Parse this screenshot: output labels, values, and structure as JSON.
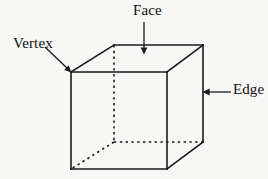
{
  "figure": {
    "background_color": "#f7f7f6",
    "ink_color": "#1a1a1a",
    "width": 268,
    "height": 179,
    "shape": {
      "name": "cube",
      "projection": "oblique",
      "front_face": [
        [
          71,
          72
        ],
        [
          167,
          72
        ],
        [
          167,
          169
        ],
        [
          71,
          169
        ]
      ],
      "back_face": [
        [
          114,
          45
        ],
        [
          203,
          45
        ],
        [
          203,
          142
        ],
        [
          114,
          142
        ]
      ],
      "solid_edges": [
        [
          [
            71,
            72
          ],
          [
            167,
            72
          ]
        ],
        [
          [
            167,
            72
          ],
          [
            167,
            169
          ]
        ],
        [
          [
            167,
            169
          ],
          [
            71,
            169
          ]
        ],
        [
          [
            71,
            169
          ],
          [
            71,
            72
          ]
        ],
        [
          [
            114,
            45
          ],
          [
            203,
            45
          ]
        ],
        [
          [
            203,
            45
          ],
          [
            203,
            142
          ]
        ],
        [
          [
            71,
            72
          ],
          [
            114,
            45
          ]
        ],
        [
          [
            167,
            72
          ],
          [
            203,
            45
          ]
        ],
        [
          [
            167,
            169
          ],
          [
            203,
            142
          ]
        ]
      ],
      "dashed_edges": [
        [
          [
            114,
            45
          ],
          [
            114,
            142
          ]
        ],
        [
          [
            114,
            142
          ],
          [
            203,
            142
          ]
        ],
        [
          [
            114,
            142
          ],
          [
            71,
            169
          ]
        ]
      ]
    },
    "labels": [
      {
        "id": "vertex",
        "text": "Vertex",
        "anchor": [
          45,
          47
        ],
        "target": [
          71,
          72
        ],
        "arrow": "diagonal-down-right"
      },
      {
        "id": "face",
        "text": "Face",
        "anchor": [
          144,
          22
        ],
        "target": [
          144,
          54
        ],
        "arrow": "vertical-down"
      },
      {
        "id": "edge",
        "text": "Edge",
        "anchor": [
          231,
          92
        ],
        "target": [
          204,
          92
        ],
        "arrow": "horizontal-left"
      }
    ]
  }
}
